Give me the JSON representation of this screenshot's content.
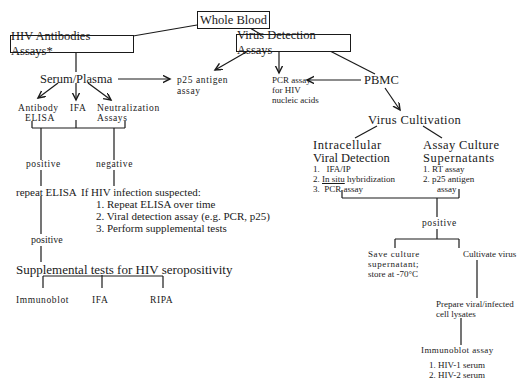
{
  "diagram": {
    "root": "Whole Blood",
    "left_branch": {
      "title": "HIV Antibodies Assays*",
      "sample": "Serum/Plasma",
      "p25": [
        "p25  antigen",
        "assay"
      ],
      "methods": {
        "elisa": [
          "Antibody",
          "ELISA"
        ],
        "ifa": "IFA",
        "neutralization": [
          "Neutralization",
          "Assays"
        ]
      },
      "positive": "positive",
      "negative": "negative",
      "repeat_elisa": "repeat ELISA",
      "positive2": "positive",
      "suspected": {
        "heading": "If HIV infection suspected:",
        "items": [
          "1.   Repeat ELISA over time",
          "2.  Viral detection assay (e.g. PCR, p25)",
          "3.  Perform  supplemental  tests"
        ]
      },
      "supplemental": {
        "title": "Supplemental  tests  for  HIV  seropositivity",
        "tests": [
          "Immunoblot",
          "IFA",
          "RIPA"
        ]
      }
    },
    "right_branch": {
      "title": "Virus Detection Assays",
      "pcr": [
        "PCR assay",
        "for  HIV",
        "nucleic  acids"
      ],
      "pbmc": "PBMC",
      "cultivation": "Virus  Cultivation",
      "intracellular": {
        "title": [
          "Intracellular",
          "Viral  Detection"
        ],
        "items": [
          {
            "num": "1.",
            "text": "IFA/IP"
          },
          {
            "num": "2.",
            "text_u": "In situ",
            "text": " hybridization"
          },
          {
            "num": "3.",
            "text": "PCR assay"
          }
        ]
      },
      "supernatants": {
        "title": [
          "Assay  Culture",
          "Supernatants"
        ],
        "items": [
          "1.  RT assay",
          "2.   p25  antigen",
          "assay"
        ]
      },
      "positive": "positive",
      "save": [
        "Save  culture",
        "supernatant;",
        "store at -70°C"
      ],
      "cultivate": "Cultivate virus",
      "lysates": [
        "Prepare  viral/infected",
        "cell lysates"
      ],
      "immunoblot": {
        "title": "Immunoblot   assay",
        "items": [
          "1.  HIV-1 serum",
          "2.  HIV-2 serum"
        ]
      }
    }
  }
}
